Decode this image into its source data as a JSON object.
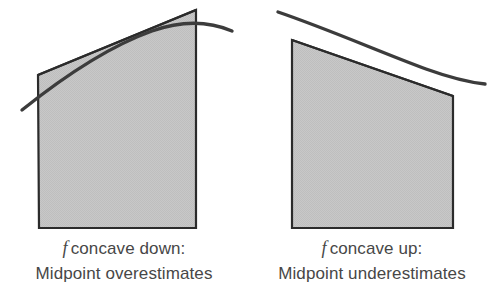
{
  "figure": {
    "colors": {
      "fill": "#c6c6c6",
      "stroke": "#2b2b2b",
      "curve": "#3c3c3c",
      "caption_text": "#474747",
      "background": "#ffffff"
    },
    "panels": [
      {
        "id": "concave-down",
        "caption_function_symbol": "f",
        "caption_line1": "concave down:",
        "caption_line2": "Midpoint overestimates",
        "region_label": "midpoint-rectangle-concave-down",
        "curve_label": "concave-down-curve",
        "tangent_label": "midpoint-tangent-line",
        "region_points": "39,228 196,228 196,10 38,75",
        "tangent_points": "38,75 196,10",
        "curve_path": "M 22,110 C 62,78 110,46 152,31 C 180,21 206,20 232,31",
        "geometry": {
          "bottom_left": [
            39,
            228
          ],
          "bottom_right": [
            196,
            228
          ],
          "top_right": [
            196,
            10
          ],
          "top_left": [
            38,
            75
          ],
          "curve_start": [
            22,
            110
          ],
          "curve_end": [
            232,
            31
          ]
        }
      },
      {
        "id": "concave-up",
        "caption_function_symbol": "f",
        "caption_line1": "concave up:",
        "caption_line2": "Midpoint underestimates",
        "region_label": "midpoint-rectangle-concave-up",
        "curve_label": "concave-up-curve",
        "tangent_label": "midpoint-tangent-line",
        "region_points": "44,228 205,228 205,96 44,40",
        "tangent_points": "44,40 205,96",
        "curve_path": "M 30,12 C 80,29 132,52 178,69 C 203,78 218,82 237,84",
        "geometry": {
          "bottom_left": [
            292,
            228
          ],
          "bottom_right": [
            453,
            228
          ],
          "top_right": [
            453,
            96
          ],
          "top_left": [
            292,
            40
          ],
          "curve_start": [
            278,
            12
          ],
          "curve_end": [
            485,
            84
          ]
        }
      }
    ]
  }
}
